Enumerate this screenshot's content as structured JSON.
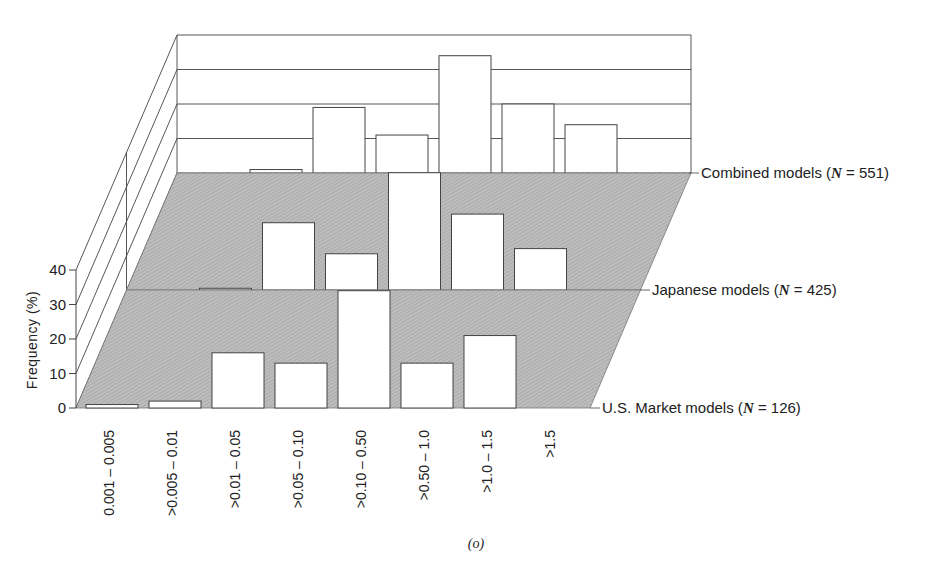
{
  "chart_data": {
    "type": "bar",
    "subtype": "3d-stacked-panels",
    "title": "",
    "caption": "(o)",
    "xlabel": "",
    "ylabel": "Frequency (%)",
    "ylim": [
      0,
      40
    ],
    "yticks": [
      0,
      10,
      20,
      30,
      40
    ],
    "categories": [
      "0.001 – 0.005",
      ">0.005 – 0.01",
      ">0.01 – 0.05",
      ">0.05 – 0.10",
      ">0.10 – 0.50",
      ">0.50 – 1.0",
      ">1.0 – 1.5",
      ">1.5"
    ],
    "series": [
      {
        "name": "U.S. Market models",
        "n_label": "126",
        "values": [
          1,
          2,
          16,
          13,
          34,
          13,
          21,
          0
        ]
      },
      {
        "name": "Japanese models",
        "n_label": "425",
        "values": [
          0,
          0.5,
          19.5,
          10.5,
          34,
          22,
          12,
          0
        ]
      },
      {
        "name": "Combined models",
        "n_label": "551",
        "values": [
          0,
          1,
          19,
          11,
          34,
          20,
          14,
          0
        ]
      }
    ],
    "grid": true,
    "legend": "right-side panel labels",
    "colors": {
      "floor": "#b9b9b9",
      "bar_fill": "#ffffff",
      "line": "#444444"
    }
  }
}
